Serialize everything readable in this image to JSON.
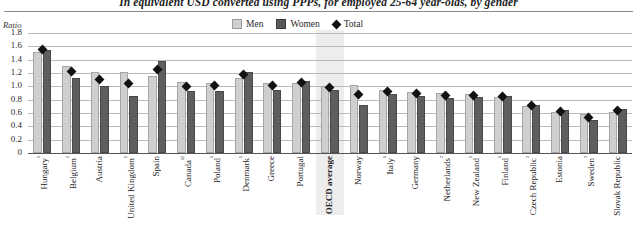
{
  "chart_data": {
    "type": "bar",
    "title": "In equivalent USD converted using PPPs, for employed 25-64 year-olds, by gender",
    "ylabel": "Ratio",
    "xlabel": "",
    "ylim": [
      0,
      1.8
    ],
    "ytick_step": 0.2,
    "grid": true,
    "legend_position": "top-center",
    "highlight_category": "OECD average",
    "categories": [
      "Hungary¹",
      "Belgium²",
      "Austria",
      "United Kingdom¹",
      "Spain",
      "Canada¹²",
      "Poland¹",
      "Denmark¹",
      "Greece",
      "Portugal",
      "OECD average",
      "Norway",
      "Italy¹",
      "Germany",
      "Netherlands²",
      "New Zealand¹",
      "Finland¹",
      "Czech Republic²",
      "Estonia",
      "Sweden³",
      "Slovak Republic"
    ],
    "ytick_labels": [
      "1.8",
      "1.6",
      "1.4",
      "1.2",
      "1.0",
      "0.8",
      "0.6",
      "0.4",
      "0.2",
      "0"
    ],
    "series": [
      {
        "name": "Men",
        "color": "#cfcfcf",
        "values": [
          1.52,
          1.3,
          1.22,
          1.22,
          1.15,
          1.06,
          1.05,
          1.12,
          1.05,
          1.05,
          1.0,
          1.02,
          0.95,
          0.92,
          0.9,
          0.88,
          0.84,
          0.7,
          0.62,
          0.58,
          0.62
        ]
      },
      {
        "name": "Women",
        "color": "#5e5e5e",
        "values": [
          1.55,
          1.12,
          1.0,
          0.86,
          1.38,
          0.93,
          0.93,
          1.22,
          0.95,
          1.08,
          0.95,
          0.72,
          0.88,
          0.86,
          0.82,
          0.84,
          0.86,
          0.72,
          0.64,
          0.5,
          0.66
        ]
      },
      {
        "name": "Total",
        "color": "#111111",
        "marker": "diamond",
        "values": [
          1.55,
          1.22,
          1.1,
          1.05,
          1.25,
          1.0,
          1.02,
          1.18,
          1.02,
          1.06,
          0.98,
          0.88,
          0.92,
          0.89,
          0.87,
          0.86,
          0.85,
          0.71,
          0.63,
          0.54,
          0.64
        ]
      }
    ]
  },
  "legend": {
    "men": "Men",
    "women": "Women",
    "total": "Total"
  }
}
